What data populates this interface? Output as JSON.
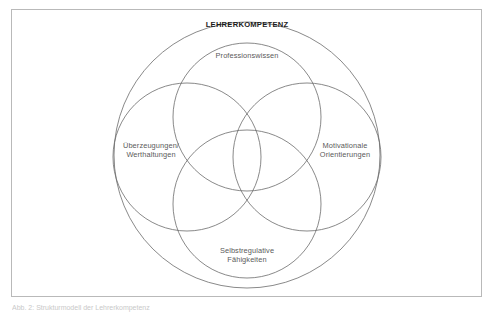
{
  "figure": {
    "title": "LEHRERKOMPETENZ",
    "diagram_type": "venn-four-circle-overlap",
    "outer_circle_label": "LEHRERKOMPETENZ",
    "segments": [
      {
        "id": "top",
        "label_line1": "Professionswissen",
        "label_line2": ""
      },
      {
        "id": "left",
        "label_line1": "Überzeugungen/",
        "label_line2": "Werthaltungen"
      },
      {
        "id": "right",
        "label_line1": "Motivationale",
        "label_line2": "Orientierungen"
      },
      {
        "id": "bottom",
        "label_line1": "Selbstregulative",
        "label_line2": "Fähigkeiten"
      }
    ]
  },
  "caption": {
    "text": "Abb. 2: Strukturmodell der Lehrerkompetenz"
  },
  "colors": {
    "frame_border": "#b9b9b9",
    "circle_stroke": "#6b6b6b",
    "label_text": "#5a5a5a",
    "title_text": "#1c1c1c",
    "background": "#ffffff"
  }
}
